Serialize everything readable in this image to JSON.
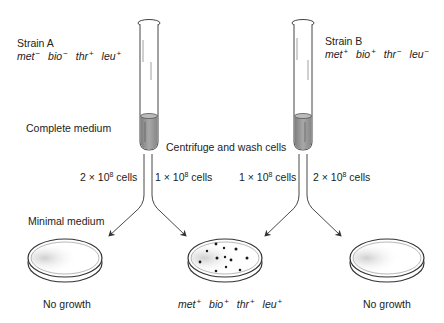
{
  "strain_a": {
    "title": "Strain A",
    "genotype": [
      {
        "gene": "met",
        "sign": "−"
      },
      {
        "gene": "bio",
        "sign": "−"
      },
      {
        "gene": "thr",
        "sign": "+"
      },
      {
        "gene": "leu",
        "sign": "+"
      }
    ]
  },
  "strain_b": {
    "title": "Strain B",
    "genotype": [
      {
        "gene": "met",
        "sign": "+"
      },
      {
        "gene": "bio",
        "sign": "+"
      },
      {
        "gene": "thr",
        "sign": "−"
      },
      {
        "gene": "leu",
        "sign": "−"
      }
    ]
  },
  "labels": {
    "complete_medium": "Complete medium",
    "centrifuge": "Centrifuge and wash cells",
    "minimal_medium": "Minimal medium"
  },
  "cell_counts": {
    "a_left": {
      "coef": "2 × 10",
      "exp": "8",
      "unit": " cells"
    },
    "a_right": {
      "coef": "1 × 10",
      "exp": "8",
      "unit": " cells"
    },
    "b_left": {
      "coef": "1 × 10",
      "exp": "8",
      "unit": " cells"
    },
    "b_right": {
      "coef": "2 × 10",
      "exp": "8",
      "unit": " cells"
    }
  },
  "plates": {
    "left": {
      "result": "No growth"
    },
    "middle": {
      "result_genotype": [
        {
          "gene": "met",
          "sign": "+"
        },
        {
          "gene": "bio",
          "sign": "+"
        },
        {
          "gene": "thr",
          "sign": "+"
        },
        {
          "gene": "leu",
          "sign": "+"
        }
      ]
    },
    "right": {
      "result": "No growth"
    }
  },
  "colors": {
    "line": "#333333",
    "culture": "#9a9a9a",
    "colony": "#1a1a1a"
  }
}
